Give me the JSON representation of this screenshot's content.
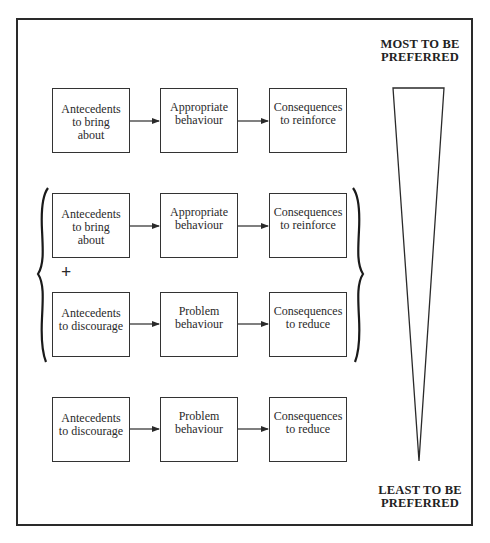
{
  "diagram": {
    "top_label": [
      "MOST TO BE",
      "PREFERRED"
    ],
    "bottom_label": [
      "LEAST TO BE",
      "PREFERRED"
    ],
    "combine_symbol": "+",
    "rows": [
      {
        "antecedent": [
          "Antecedents",
          "to bring",
          "about"
        ],
        "behaviour": [
          "Appropriate",
          "behaviour"
        ],
        "consequence": [
          "Consequences",
          "to reinforce"
        ]
      },
      {
        "antecedent": [
          "Antecedents",
          "to bring",
          "about"
        ],
        "behaviour": [
          "Appropriate",
          "behaviour"
        ],
        "consequence": [
          "Consequences",
          "to reinforce"
        ]
      },
      {
        "antecedent": [
          "Antecedents",
          "to discourage"
        ],
        "behaviour": [
          "Problem",
          "behaviour"
        ],
        "consequence": [
          "Consequences",
          "to reduce"
        ]
      },
      {
        "antecedent": [
          "Antecedents",
          "to discourage"
        ],
        "behaviour": [
          "Problem",
          "behaviour"
        ],
        "consequence": [
          "Consequences",
          "to reduce"
        ]
      }
    ],
    "grouped_rows": [
      1,
      2
    ],
    "preference_scale": "wedge-narrowing-downward",
    "colors": {
      "line": "#2a2a2a",
      "background": "#ffffff"
    }
  }
}
